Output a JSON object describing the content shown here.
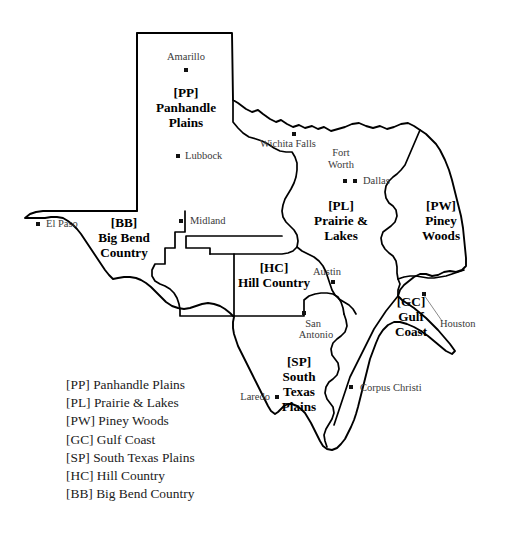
{
  "map": {
    "title": "Texas Tourism Regions",
    "regions": [
      {
        "code": "[PP]",
        "name_line1": "Panhandle",
        "name_line2": "Plains",
        "full_name": "Panhandle Plains",
        "label_x": 186,
        "label_y": 97
      },
      {
        "code": "[PL]",
        "name_line1": "Prairie &",
        "name_line2": "Lakes",
        "full_name": "Prairie & Lakes",
        "label_x": 341,
        "label_y": 210
      },
      {
        "code": "[PW]",
        "name_line1": "Piney",
        "name_line2": "Woods",
        "full_name": "Piney Woods",
        "label_x": 441,
        "label_y": 210
      },
      {
        "code": "[GC]",
        "name_line1": "Gulf",
        "name_line2": "Coast",
        "full_name": "Gulf Coast",
        "label_x": 411,
        "label_y": 306
      },
      {
        "code": "[SP]",
        "name_line1": "South",
        "name_line2": "Texas",
        "name_line3": "Plains",
        "full_name": "South Texas Plains",
        "label_x": 299,
        "label_y": 366
      },
      {
        "code": "[HC]",
        "name_line1": "Hill Country",
        "full_name": "Hill Country",
        "label_x": 274,
        "label_y": 272
      },
      {
        "code": "[BB]",
        "name_line1": "Big Bend",
        "name_line2": "Country",
        "full_name": "Big Bend Country",
        "label_x": 124,
        "label_y": 227
      }
    ],
    "cities": [
      {
        "name": "Amarillo",
        "dot_x": 186,
        "dot_y": 70,
        "label_x": 186,
        "label_y": 60,
        "anchor": "middle"
      },
      {
        "name": "Lubbock",
        "dot_x": 178,
        "dot_y": 156,
        "label_x": 185,
        "label_y": 159,
        "anchor": "start"
      },
      {
        "name": "Wichita Falls",
        "dot_x": 294,
        "dot_y": 134,
        "label_x": 288,
        "label_y": 147,
        "anchor": "middle"
      },
      {
        "name": "Fort",
        "dot_x": null,
        "dot_y": null,
        "label_x": 341,
        "label_y": 156,
        "anchor": "middle"
      },
      {
        "name": "Worth",
        "dot_x": 345,
        "dot_y": 181,
        "label_x": 341,
        "label_y": 168,
        "anchor": "middle"
      },
      {
        "name": "Dallas",
        "dot_x": 355,
        "dot_y": 181,
        "label_x": 363,
        "label_y": 184,
        "anchor": "start"
      },
      {
        "name": "El Paso",
        "dot_x": 38,
        "dot_y": 224,
        "label_x": 46,
        "label_y": 227,
        "anchor": "start"
      },
      {
        "name": "Midland",
        "dot_x": 181,
        "dot_y": 221,
        "label_x": 190,
        "label_y": 224,
        "anchor": "start"
      },
      {
        "name": "Austin",
        "dot_x": 333,
        "dot_y": 282,
        "label_x": 327,
        "label_y": 275,
        "anchor": "middle"
      },
      {
        "name": "San",
        "dot_x": 304,
        "dot_y": 313,
        "label_x": 313,
        "label_y": 327,
        "anchor": "middle"
      },
      {
        "name": "Antonio",
        "dot_x": null,
        "dot_y": null,
        "label_x": 316,
        "label_y": 338,
        "anchor": "middle"
      },
      {
        "name": "Houston",
        "dot_x": 424,
        "dot_y": 294,
        "label_x": 440,
        "label_y": 327,
        "anchor": "start"
      },
      {
        "name": "Corpus Christi",
        "dot_x": 351,
        "dot_y": 387,
        "label_x": 360,
        "label_y": 391,
        "anchor": "start"
      },
      {
        "name": "Laredo",
        "dot_x": 277,
        "dot_y": 397,
        "label_x": 270,
        "label_y": 400,
        "anchor": "end"
      }
    ]
  },
  "legend": {
    "items": [
      {
        "code": "[PP]",
        "label": "Panhandle Plains",
        "text": "[PP] Panhandle Plains"
      },
      {
        "code": "[PL]",
        "label": "Prairie & Lakes",
        "text": "[PL] Prairie & Lakes"
      },
      {
        "code": "[PW]",
        "label": "Piney Woods",
        "text": "[PW] Piney Woods"
      },
      {
        "code": "[GC]",
        "label": "Gulf Coast",
        "text": "[GC] Gulf Coast"
      },
      {
        "code": "[SP]",
        "label": "South Texas Plains",
        "text": "[SP] South Texas Plains"
      },
      {
        "code": "[HC]",
        "label": "Hill Country",
        "text": "[HC] Hill Country"
      },
      {
        "code": "[BB]",
        "label": "Big Bend Country",
        "text": "[BB] Big Bend Country"
      }
    ]
  },
  "colors": {
    "background": "#ffffff",
    "outline": "#000000",
    "city_text": "#3a3a3a",
    "legend_text": "#1a1a1a",
    "leader": "#8a8a8a"
  }
}
